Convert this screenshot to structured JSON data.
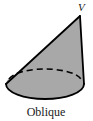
{
  "figure": {
    "name": "oblique-cone",
    "caption": "Oblique",
    "apex_label": "V",
    "colors": {
      "background": "#ffffff",
      "solid_fill": "#a8a8a8",
      "outline": "#000000",
      "hidden_edge": "#000000",
      "text": "#1a1a1a"
    },
    "geometry": {
      "apex": {
        "x": 80,
        "y": 16
      },
      "base_ellipse": {
        "cx": 45,
        "cy": 84,
        "rx": 39,
        "ry": 15
      },
      "left_vertex": {
        "x": 6,
        "y": 84
      },
      "right_vertex": {
        "x": 84,
        "y": 84
      },
      "slant_left_label": "left-slant-edge",
      "slant_right_label": "right-slant-edge",
      "hidden_arc_label": "base-back-arc-dashed",
      "dash_pattern": "6 4",
      "stroke_width": 1.6
    },
    "labels": {
      "apex_position": {
        "x": 78,
        "y": 11
      },
      "caption_position": {
        "x": 46,
        "y": 115
      }
    }
  }
}
